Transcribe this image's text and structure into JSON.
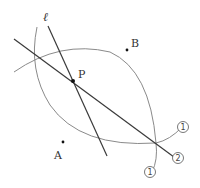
{
  "diagram": {
    "type": "geometric-construction",
    "points": {
      "P": {
        "label": "P"
      },
      "A": {
        "label": "A"
      },
      "B": {
        "label": "B"
      }
    },
    "line_label": "ℓ",
    "step_markers": {
      "arc_a_label": "①",
      "arc_b_label": "①",
      "bisector_label": "②"
    },
    "markers": {
      "arc_a_num": "1",
      "arc_b_num": "1",
      "bisector_num": "2"
    },
    "colors": {
      "arc": "#8a8a8a",
      "line": "#3a3a3a",
      "point": "#111111"
    }
  }
}
